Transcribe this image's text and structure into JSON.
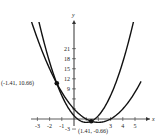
{
  "chart_data": {
    "type": "line",
    "title": "",
    "xlabel": "x",
    "ylabel": "y",
    "xlim": [
      -3.5,
      5.5
    ],
    "ylim": [
      -4,
      24
    ],
    "x_ticks": [
      -3,
      -2,
      -1,
      1,
      2,
      3,
      4,
      5
    ],
    "x_tick_labels": [
      "-3",
      "-2",
      "-1",
      "3",
      "4",
      "5"
    ],
    "y_ticks": [
      -3,
      3,
      6,
      9,
      12,
      15,
      18,
      21
    ],
    "y_tick_labels": [
      "-3",
      "9",
      "12",
      "15",
      "18",
      "21"
    ],
    "grid": false,
    "series": [
      {
        "name": "y = x^2 - 4x + 3",
        "a": 1,
        "b": -4,
        "c": 3
      },
      {
        "name": "y = 2x^2 - 4x + 1",
        "a": 2,
        "b": -4,
        "c": 1
      }
    ],
    "points": [
      {
        "x": -1.41,
        "y": 10.66,
        "label": "(-1.41, 10.66)"
      },
      {
        "x": 1.41,
        "y": -0.66,
        "label": "(1.41, -0.66)"
      }
    ]
  }
}
